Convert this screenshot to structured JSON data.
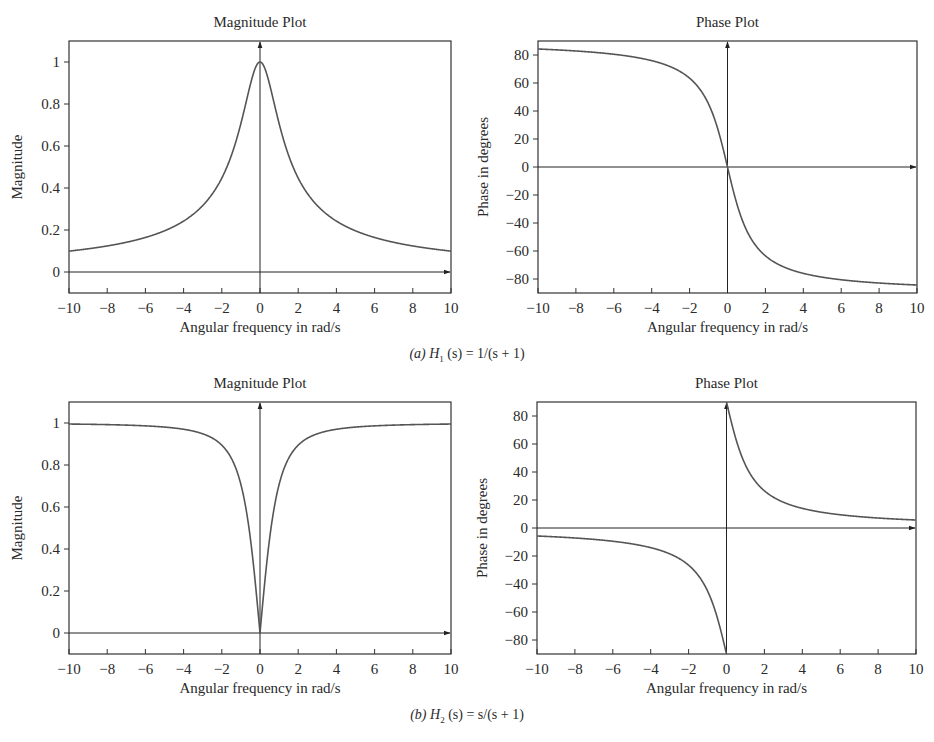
{
  "figure": {
    "captions": [
      {
        "label": "(a)",
        "func": "H",
        "sub": "1",
        "rest": " (s) = 1/(s + 1)"
      },
      {
        "label": "(b)",
        "func": "H",
        "sub": "2",
        "rest": " (s) = s/(s + 1)"
      }
    ],
    "colors": {
      "curve": "#555555",
      "axis": "#222222",
      "frame": "#333333",
      "text": "#2a2a2a"
    }
  },
  "chart_data": [
    {
      "id": "a-magnitude",
      "type": "line",
      "title": "Magnitude Plot",
      "xlabel": "Angular frequency in rad/s",
      "ylabel": "Magnitude",
      "xlim": [
        -10,
        10
      ],
      "ylim": [
        -0.1,
        1.1
      ],
      "xticks": [
        -10,
        -8,
        -6,
        -4,
        -2,
        0,
        2,
        4,
        6,
        8,
        10
      ],
      "xtick_labels": [
        "−10",
        "−8",
        "−6",
        "−4",
        "−2",
        "0",
        "2",
        "4",
        "6",
        "8",
        "10"
      ],
      "yticks": [
        0,
        0.2,
        0.4,
        0.6,
        0.8,
        1
      ],
      "ytick_labels": [
        "0",
        "0.2",
        "0.4",
        "0.6",
        "0.8",
        "1"
      ],
      "grid": false,
      "series": [
        {
          "name": "|H1(jω)| = 1/√(1+ω²)",
          "x": [
            -10,
            -8,
            -6,
            -4,
            -2,
            -1,
            0,
            1,
            2,
            4,
            6,
            8,
            10
          ],
          "values": [
            0.1,
            0.12,
            0.16,
            0.24,
            0.45,
            0.71,
            1.0,
            0.71,
            0.45,
            0.24,
            0.16,
            0.12,
            0.1
          ]
        }
      ],
      "frame_px": {
        "left": 69,
        "top": 41,
        "right": 451,
        "bottom": 293
      }
    },
    {
      "id": "a-phase",
      "type": "line",
      "title": "Phase Plot",
      "xlabel": "Angular frequency in rad/s",
      "ylabel": "Phase in degrees",
      "xlim": [
        -10,
        10
      ],
      "ylim": [
        -90,
        90
      ],
      "xticks": [
        -10,
        -8,
        -6,
        -4,
        -2,
        0,
        2,
        4,
        6,
        8,
        10
      ],
      "xtick_labels": [
        "−10",
        "−8",
        "−6",
        "−4",
        "−2",
        "0",
        "2",
        "4",
        "6",
        "8",
        "10"
      ],
      "yticks": [
        -80,
        -60,
        -40,
        -20,
        0,
        20,
        40,
        60,
        80
      ],
      "ytick_labels": [
        "−80",
        "−60",
        "−40",
        "−20",
        "0",
        "20",
        "40",
        "60",
        "80"
      ],
      "grid": false,
      "series": [
        {
          "name": "∠H1(jω) = −atan(ω)",
          "x": [
            -10,
            -8,
            -6,
            -4,
            -2,
            -1,
            0,
            1,
            2,
            4,
            6,
            8,
            10
          ],
          "values": [
            84.3,
            82.9,
            80.5,
            76.0,
            63.4,
            45.0,
            0,
            -45.0,
            -63.4,
            -76.0,
            -80.5,
            -82.9,
            -84.3
          ]
        }
      ],
      "frame_px": {
        "left": 538,
        "top": 41,
        "right": 917,
        "bottom": 293
      }
    },
    {
      "id": "b-magnitude",
      "type": "line",
      "title": "Magnitude Plot",
      "xlabel": "Angular frequency in rad/s",
      "ylabel": "Magnitude",
      "xlim": [
        -10,
        10
      ],
      "ylim": [
        -0.1,
        1.1
      ],
      "xticks": [
        -10,
        -8,
        -6,
        -4,
        -2,
        0,
        2,
        4,
        6,
        8,
        10
      ],
      "xtick_labels": [
        "−10",
        "−8",
        "−6",
        "−4",
        "−2",
        "0",
        "2",
        "4",
        "6",
        "8",
        "10"
      ],
      "yticks": [
        0,
        0.2,
        0.4,
        0.6,
        0.8,
        1
      ],
      "ytick_labels": [
        "0",
        "0.2",
        "0.4",
        "0.6",
        "0.8",
        "1"
      ],
      "grid": false,
      "series": [
        {
          "name": "|H2(jω)| = |ω|/√(1+ω²)",
          "x": [
            -10,
            -8,
            -6,
            -4,
            -2,
            -1,
            0,
            1,
            2,
            4,
            6,
            8,
            10
          ],
          "values": [
            1.0,
            1.0,
            1.0,
            0.97,
            0.89,
            0.71,
            0.0,
            0.71,
            0.89,
            0.97,
            1.0,
            1.0,
            1.0
          ]
        }
      ],
      "frame_px": {
        "left": 69,
        "top": 402,
        "right": 451,
        "bottom": 654
      }
    },
    {
      "id": "b-phase",
      "type": "line",
      "title": "Phase Plot",
      "xlabel": "Angular frequency in rad/s",
      "ylabel": "Phase in degrees",
      "xlim": [
        -10,
        10
      ],
      "ylim": [
        -90,
        90
      ],
      "xticks": [
        -10,
        -8,
        -6,
        -4,
        -2,
        0,
        2,
        4,
        6,
        8,
        10
      ],
      "xtick_labels": [
        "−10",
        "−8",
        "−6",
        "−4",
        "−2",
        "0",
        "2",
        "4",
        "6",
        "8",
        "10"
      ],
      "yticks": [
        -80,
        -60,
        -40,
        -20,
        0,
        20,
        40,
        60,
        80
      ],
      "ytick_labels": [
        "−80",
        "−60",
        "−40",
        "−20",
        "0",
        "20",
        "40",
        "60",
        "80"
      ],
      "grid": false,
      "series": [
        {
          "name": "∠H2(jω) = 90·sgn(ω) − atan(ω)",
          "x": [
            -10,
            -8,
            -6,
            -4,
            -2,
            -1,
            -0.01,
            0.01,
            1,
            2,
            4,
            6,
            8,
            10
          ],
          "values": [
            -5.7,
            -7.1,
            -9.5,
            -14.0,
            -26.6,
            -45.0,
            -89.4,
            89.4,
            45.0,
            26.6,
            14.0,
            9.5,
            7.1,
            5.7
          ]
        }
      ],
      "frame_px": {
        "left": 537,
        "top": 402,
        "right": 916,
        "bottom": 654
      }
    }
  ]
}
